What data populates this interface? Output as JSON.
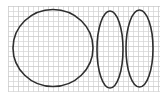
{
  "diagram": {
    "title": "",
    "background": "#ffffff",
    "grid": {
      "x0": 8,
      "y0": 6,
      "x1": 160,
      "y1": 92,
      "cell": 5,
      "color": "#d4d4d4",
      "major_every": 2,
      "major_color": "#c4c4c4"
    },
    "shapes": [
      {
        "id": "circle-large",
        "type": "ellipse",
        "cx": 53,
        "cy": 48,
        "rx": 40,
        "ry": 38.5,
        "stroke": "#2e2e2e",
        "stroke_width": 1.6
      },
      {
        "id": "ellipse-middle",
        "type": "ellipse",
        "cx": 110,
        "cy": 49.5,
        "rx": 13,
        "ry": 38.5,
        "stroke": "#2e2e2e",
        "stroke_width": 1.6
      },
      {
        "id": "ellipse-right",
        "type": "ellipse",
        "cx": 139.5,
        "cy": 48.5,
        "rx": 13.5,
        "ry": 38.5,
        "stroke": "#2e2e2e",
        "stroke_width": 1.6
      }
    ]
  }
}
